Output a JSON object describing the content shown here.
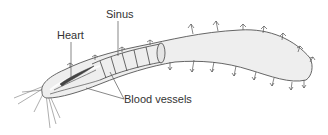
{
  "diagram": {
    "labels": {
      "heart": "Heart",
      "sinus": "Sinus",
      "blood_vessels": "Blood vessels"
    },
    "colors": {
      "body_fill": "#eeeeee",
      "outline": "#555555",
      "heart_fill": "#444444",
      "label_text": "#333333",
      "leader_line": "#555555"
    }
  }
}
